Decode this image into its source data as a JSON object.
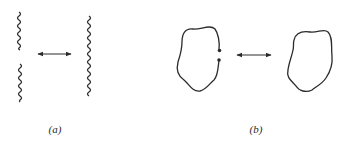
{
  "figure": {
    "stroke_color": "#2b2b2b",
    "background": "#ffffff",
    "panels": [
      {
        "id": "a",
        "label": "(a)",
        "description": "Two separated wavy string segments transform into one continuous wavy string",
        "left_items": [
          "upper wavy segment",
          "lower wavy segment"
        ],
        "right_items": [
          "single continuous wavy string"
        ],
        "relation": "double-headed arrow"
      },
      {
        "id": "b",
        "label": "(b)",
        "description": "Open loop with two endpoint dots transforms into a closed loop",
        "left_items": [
          "open loop with endpoints"
        ],
        "right_items": [
          "closed loop"
        ],
        "relation": "double-headed arrow"
      }
    ]
  }
}
